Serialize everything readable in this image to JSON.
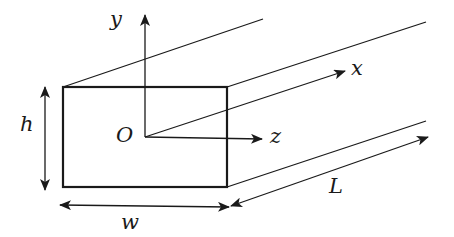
{
  "diagram": {
    "colors": {
      "stroke": "#1a1a1a",
      "background": "#ffffff"
    },
    "labels": {
      "y_axis": "y",
      "x_axis": "x",
      "z_axis": "z",
      "origin": "O",
      "height": "h",
      "width": "w",
      "length": "L"
    },
    "cross_section": {
      "left": 63,
      "top": 87,
      "right": 227,
      "bottom": 187
    },
    "origin_point": [
      145,
      137
    ],
    "axes": {
      "y": {
        "from": [
          145,
          137
        ],
        "to": [
          145,
          15
        ]
      },
      "x": {
        "from": [
          145,
          137
        ],
        "to": [
          345,
          71
        ]
      },
      "z": {
        "from": [
          145,
          137
        ],
        "to": [
          262,
          139
        ]
      }
    },
    "extrusion_edges": [
      {
        "from": [
          63,
          87
        ],
        "to": [
          263,
          19
        ]
      },
      {
        "from": [
          227,
          87
        ],
        "to": [
          426,
          22
        ]
      },
      {
        "from": [
          227,
          187
        ],
        "to": [
          426,
          121
        ]
      }
    ],
    "dimensions": {
      "h": {
        "from": [
          45,
          87
        ],
        "to": [
          45,
          190
        ]
      },
      "w": {
        "from": [
          60,
          205
        ],
        "to": [
          229,
          207
        ]
      },
      "L": {
        "from": [
          231,
          206
        ],
        "to": [
          428,
          137
        ]
      }
    }
  }
}
